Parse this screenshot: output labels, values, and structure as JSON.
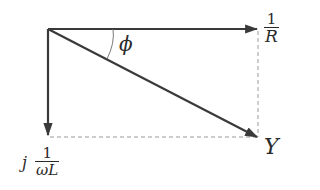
{
  "diagram": {
    "type": "phasor-diagram",
    "vectors": [
      {
        "name": "conductance",
        "label_prefix": "",
        "label_num": "1",
        "label_den": "R",
        "direction": "horizontal"
      },
      {
        "name": "susceptance",
        "label_prefix": "j",
        "label_num": "1",
        "label_den": "ωL",
        "direction": "vertical-down"
      },
      {
        "name": "admittance",
        "label": "Y",
        "direction": "diagonal"
      }
    ],
    "angle_label": "ϕ",
    "colors": {
      "line": "#3a3a3a",
      "dashed": "#9a9a9a",
      "text": "#2a2a2a"
    }
  }
}
